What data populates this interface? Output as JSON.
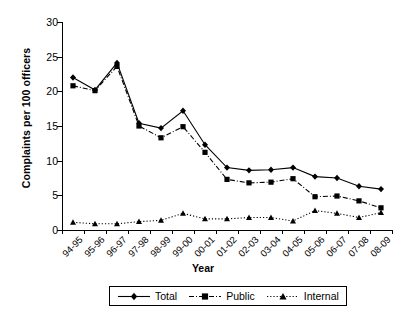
{
  "chart_data": {
    "type": "line",
    "title": "",
    "xlabel": "Year",
    "ylabel": "Complaints per 100 officers",
    "ylim": [
      0,
      30
    ],
    "yticks": [
      0,
      5,
      10,
      15,
      20,
      25,
      30
    ],
    "grid": false,
    "legend_position": "bottom",
    "categories": [
      "94-95",
      "95-96",
      "96-97",
      "97-98",
      "98-99",
      "99-00",
      "00-01",
      "01-02",
      "02-03",
      "03-04",
      "04-05",
      "05-06",
      "06-07",
      "07-08",
      "08-09"
    ],
    "series": [
      {
        "name": "Total",
        "marker": "diamond",
        "line_style": "solid",
        "color": "#000000",
        "values": [
          22.0,
          20.2,
          24.1,
          15.4,
          14.7,
          17.2,
          12.3,
          9.0,
          8.6,
          8.7,
          9.0,
          7.7,
          7.5,
          6.3,
          5.9
        ]
      },
      {
        "name": "Public",
        "marker": "square",
        "line_style": "dashdot",
        "color": "#000000",
        "values": [
          20.8,
          20.1,
          23.6,
          15.0,
          13.3,
          14.9,
          11.2,
          7.3,
          6.8,
          6.9,
          7.4,
          4.8,
          4.9,
          4.2,
          3.2
        ]
      },
      {
        "name": "Internal",
        "marker": "triangle",
        "line_style": "dotted",
        "color": "#000000",
        "values": [
          1.1,
          0.9,
          0.9,
          1.2,
          1.4,
          2.4,
          1.6,
          1.6,
          1.8,
          1.8,
          1.3,
          2.8,
          2.4,
          1.8,
          2.5
        ]
      }
    ]
  },
  "axes": {
    "y_title": "Complaints per 100 officers",
    "x_title": "Year"
  },
  "legend": {
    "items": [
      {
        "label": "Total"
      },
      {
        "label": "Public"
      },
      {
        "label": "Internal"
      }
    ]
  }
}
